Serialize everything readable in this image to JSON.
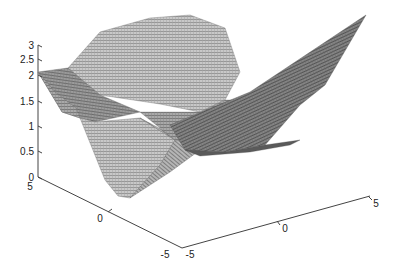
{
  "chart_data": {
    "type": "surface",
    "title": "",
    "xlabel": "",
    "ylabel": "",
    "zlabel": "",
    "xlim": [
      -5,
      5
    ],
    "ylim": [
      -5,
      5
    ],
    "zlim": [
      0,
      3
    ],
    "grid": false,
    "mesh": true,
    "colormap": "gray",
    "z_ticks": [
      "0",
      "0.5",
      "1",
      "1.5",
      "2",
      "2.5",
      "3"
    ],
    "x_ticks": [
      "-5",
      "0",
      "5"
    ],
    "y_ticks": [
      "5",
      "0",
      "-5"
    ],
    "surface_description": "Piecewise-linear (faceted) gray mesh surface with a peak near z=3 at the back, a flat left plateau near z=2, a long thin fin extending to the right near z=2, and a V-shaped trough dipping toward z=0 near the front center.",
    "approx_features": [
      {
        "name": "back-peak",
        "z": 3.0
      },
      {
        "name": "left-plateau",
        "z": 2.0
      },
      {
        "name": "right-fin-tip",
        "z": 2.2
      },
      {
        "name": "front-trough",
        "z": 0.2
      }
    ]
  },
  "axes": {
    "z": [
      {
        "label": "3",
        "y": 45
      },
      {
        "label": "2.5",
        "y": 59
      },
      {
        "label": "2",
        "y": 75
      },
      {
        "label": "1.5",
        "y": 101
      },
      {
        "label": "1",
        "y": 126
      },
      {
        "label": "0.5",
        "y": 151
      },
      {
        "label": "0",
        "y": 177
      }
    ],
    "y_axis": [
      {
        "label": "5",
        "x": 30,
        "y": 190
      },
      {
        "label": "0",
        "x": 100,
        "y": 222
      },
      {
        "label": "-5",
        "x": 165,
        "y": 258
      }
    ],
    "x_axis": [
      {
        "label": "-5",
        "x": 190,
        "y": 258
      },
      {
        "label": "0",
        "x": 285,
        "y": 232
      },
      {
        "label": "5",
        "x": 376,
        "y": 207
      }
    ]
  }
}
